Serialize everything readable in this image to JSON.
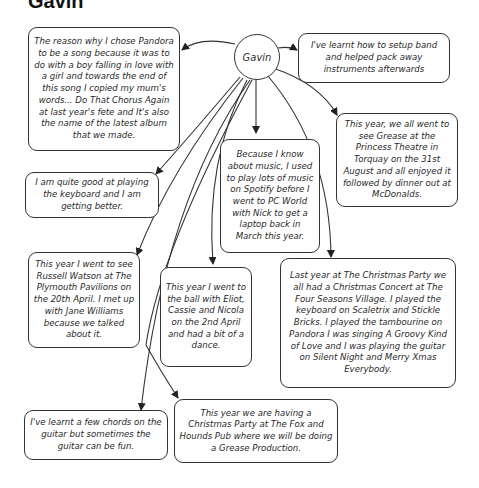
{
  "title": "Gavin",
  "center_node": {
    "label": "Gavin"
  },
  "nodes": [
    {
      "id": "pandora",
      "text": "The reason why I chose Pandora to be a song because it was to do with a boy falling in love with a girl and towards the end of this song I copied my mum's words... Do That Chorus Again at last year's fete and It's also the name of the latest album that we made."
    },
    {
      "id": "setup",
      "text": "I've learnt how to setup band and helped pack away instruments afterwards"
    },
    {
      "id": "grease",
      "text": "This year, we all went to see Grease at the Princess Theatre in Torquay on the 31st August and all enjoyed it followed by dinner out at McDonalds."
    },
    {
      "id": "keyboard",
      "text": "I am quite good at playing the keyboard and I am getting better."
    },
    {
      "id": "music",
      "text": "Because I know about music, I used to play lots of music on Spotify before I went to PC World with Nick to get a laptop back in March this year."
    },
    {
      "id": "russell",
      "text": "This year I went to see Russell Watson at The Plymouth Pavilions on the 20th April. I met up with Jane Williams because we talked about it."
    },
    {
      "id": "ball",
      "text": "This year I went to the ball with Eliot, Cassie and Nicola on the 2nd April and had a bit of a dance."
    },
    {
      "id": "christmas",
      "text": "Last year at The Christmas Party we all had a Christmas Concert at The Four Seasons Village. I played the keyboard on Scaletrix and Stickle Bricks. I played the tambourine on Pandora I was singing A Groovy Kind of Love and I was playing the guitar on Silent Night and Merry Xmas Everybody."
    },
    {
      "id": "guitar",
      "text": "I've learnt a few chords on the guitar but sometimes the guitar can be fun."
    },
    {
      "id": "foxhounds",
      "text": "This year we are having a Christmas Party at The Fox and Hounds Pub where we will be doing a Grease Production."
    }
  ]
}
